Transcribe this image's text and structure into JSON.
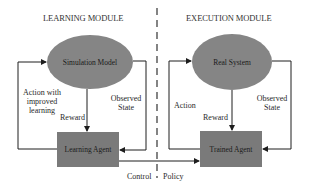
{
  "headings": {
    "left": "LEARNING MODULE",
    "right": "EXECUTION MODULE"
  },
  "learning_module": {
    "environment": "Simulation Model",
    "agent": "Learning Agent",
    "action_label_lines": [
      "Action with",
      "improved",
      "learning"
    ],
    "reward_label": "Reward",
    "observed_label_lines": [
      "Observed",
      "State"
    ]
  },
  "execution_module": {
    "environment": "Real System",
    "agent": "Trained Agent",
    "action_label": "Action",
    "reward_label": "Reward",
    "observed_label_lines": [
      "Observed",
      "State"
    ]
  },
  "transfer": {
    "left_label": "Control",
    "right_label": "Policy"
  },
  "colors": {
    "ellipse_fill": "#858585",
    "box_fill": "#7a7a7a",
    "line": "#1e1e1e",
    "text": "#2a2a2a"
  }
}
